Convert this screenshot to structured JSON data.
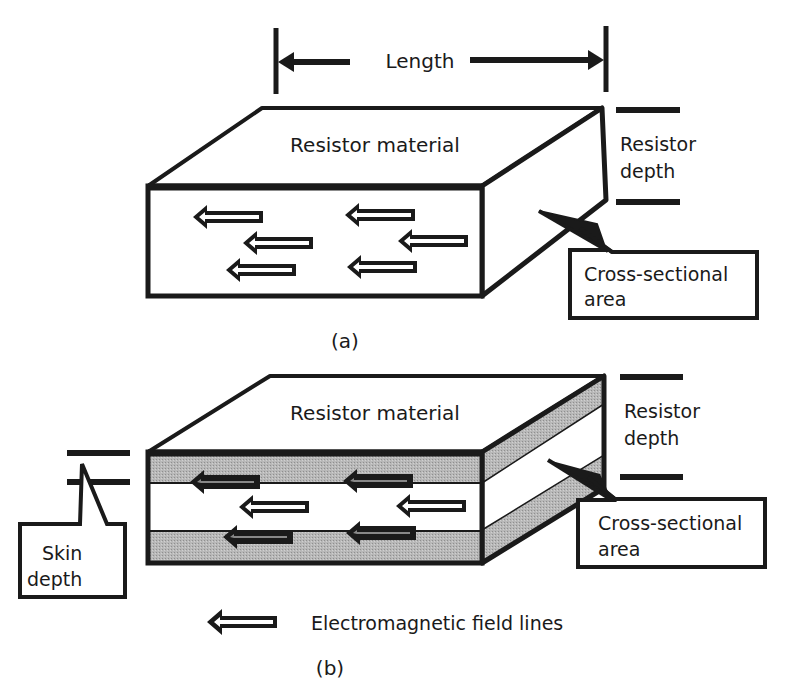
{
  "figure_a": {
    "length_label": "Length",
    "material_label": "Resistor material",
    "depth_label_line1": "Resistor",
    "depth_label_line2": "depth",
    "cross_section_line1": "Cross-sectional",
    "cross_section_line2": "area",
    "caption": "(a)"
  },
  "figure_b": {
    "material_label": "Resistor material",
    "depth_label_line1": "Resistor",
    "depth_label_line2": "depth",
    "cross_section_line1": "Cross-sectional",
    "cross_section_line2": "area",
    "skin_depth_line1": "Skin",
    "skin_depth_line2": "depth",
    "caption": "(b)"
  },
  "legend": {
    "icon": "hollow-left-arrow-icon",
    "label": "Electromagnetic field lines"
  },
  "colors": {
    "stroke": "#1a1a1a",
    "shading": "#b4b4b4",
    "background": "#ffffff"
  }
}
